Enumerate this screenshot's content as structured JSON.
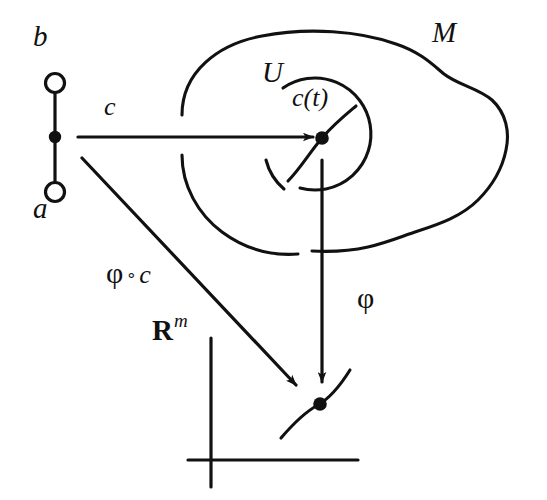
{
  "figure": {
    "kind": "mathematical-diagram",
    "background_color": "#ffffff",
    "stroke_color": "#111111",
    "width": 547,
    "height": 500
  },
  "labels": {
    "interval_top": "b",
    "interval_bottom": "a",
    "curve_map": "c",
    "manifold": "M",
    "chart_domain": "U",
    "curve_point": "c(t)",
    "chart_map": "φ",
    "composition_phi": "φ",
    "composition_operator": "∘",
    "composition_curve": "c",
    "euclidean_space": "R",
    "euclidean_dimension": "m"
  },
  "elements": {
    "interval": {
      "name": "domain-interval",
      "open_endpoint_top": "b",
      "open_endpoint_bottom": "a",
      "marked_point_filled": true
    },
    "manifold_blob": {
      "name": "manifold-M-outline",
      "closed": false,
      "has_left_gap": true
    },
    "chart_circle": {
      "name": "neighborhood-U-circle",
      "gaps": [
        "left",
        "bottom"
      ]
    },
    "curve_on_manifold": {
      "name": "curve-through-ct",
      "marked_point_filled": true
    },
    "axes": {
      "name": "euclidean-axes",
      "vertical": true,
      "horizontal": true
    },
    "curve_in_rm": {
      "name": "image-curve-in-rm",
      "marked_point_filled": true
    }
  },
  "arrows": [
    {
      "name": "arrow-c",
      "label": "c",
      "from": "interval-point",
      "to": "c(t)"
    },
    {
      "name": "arrow-phi",
      "label": "φ",
      "from": "U",
      "to": "R^m"
    },
    {
      "name": "arrow-phi-of-c",
      "label": "φ ∘ c",
      "from": "interval-point",
      "to": "R^m"
    }
  ]
}
